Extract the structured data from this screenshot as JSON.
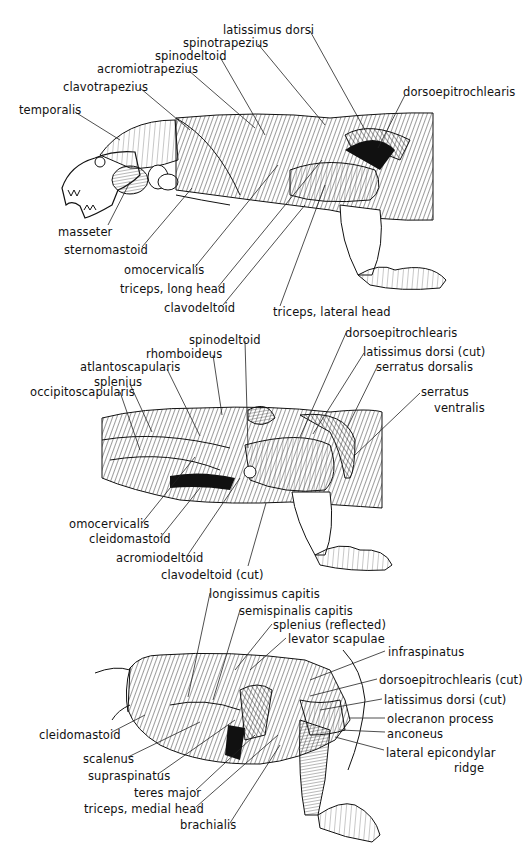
{
  "figure": {
    "panels": [
      {
        "id": "superficial",
        "labels": [
          {
            "text": "latissimus dorsi",
            "x": 223,
            "y": 24
          },
          {
            "text": "spinotrapezius",
            "x": 183,
            "y": 37
          },
          {
            "text": "spinodeltoid",
            "x": 155,
            "y": 50
          },
          {
            "text": "acromiotrapezius",
            "x": 97,
            "y": 63
          },
          {
            "text": "clavotrapezius",
            "x": 63,
            "y": 81
          },
          {
            "text": "dorsoepitrochlearis",
            "x": 403,
            "y": 86
          },
          {
            "text": "temporalis",
            "x": 19,
            "y": 104
          },
          {
            "text": "masseter",
            "x": 58,
            "y": 226
          },
          {
            "text": "sternomastoid",
            "x": 64,
            "y": 244
          },
          {
            "text": "omocervicalis",
            "x": 124,
            "y": 264
          },
          {
            "text": "triceps, long head",
            "x": 120,
            "y": 283
          },
          {
            "text": "clavodeltoid",
            "x": 164,
            "y": 302
          },
          {
            "text": "triceps, lateral head",
            "x": 273,
            "y": 306
          }
        ]
      },
      {
        "id": "intermediate",
        "labels": [
          {
            "text": "spinodeltoid",
            "x": 189,
            "y": 334
          },
          {
            "text": "dorsoepitrochlearis",
            "x": 345,
            "y": 327
          },
          {
            "text": "rhomboideus",
            "x": 146,
            "y": 348
          },
          {
            "text": "latissimus dorsi (cut)",
            "x": 363,
            "y": 346
          },
          {
            "text": "atlantoscapularis",
            "x": 80,
            "y": 361
          },
          {
            "text": "serratus dorsalis",
            "x": 376,
            "y": 361
          },
          {
            "text": "splenius",
            "x": 94,
            "y": 376
          },
          {
            "text": "occipitoscapularis",
            "x": 30,
            "y": 386
          },
          {
            "text": "serratus",
            "x": 421,
            "y": 386
          },
          {
            "text": "ventralis",
            "x": 434,
            "y": 402
          },
          {
            "text": "omocervicalis",
            "x": 69,
            "y": 518
          },
          {
            "text": "cleidomastoid",
            "x": 89,
            "y": 533
          },
          {
            "text": "acromiodeltoid",
            "x": 116,
            "y": 552
          },
          {
            "text": "clavodeltoid (cut)",
            "x": 161,
            "y": 569
          }
        ]
      },
      {
        "id": "deep",
        "labels": [
          {
            "text": "longissimus capitis",
            "x": 209,
            "y": 588
          },
          {
            "text": "semispinalis capitis",
            "x": 239,
            "y": 605
          },
          {
            "text": "splenius (reflected)",
            "x": 273,
            "y": 619
          },
          {
            "text": "levator scapulae",
            "x": 288,
            "y": 633
          },
          {
            "text": "infraspinatus",
            "x": 388,
            "y": 646
          },
          {
            "text": "dorsoepitrochlearis (cut)",
            "x": 379,
            "y": 674
          },
          {
            "text": "latissimus dorsi (cut)",
            "x": 384,
            "y": 694
          },
          {
            "text": "olecranon process",
            "x": 387,
            "y": 713
          },
          {
            "text": "cleidomastoid",
            "x": 39,
            "y": 729
          },
          {
            "text": "anconeus",
            "x": 387,
            "y": 728
          },
          {
            "text": "lateral epicondylar",
            "x": 386,
            "y": 747
          },
          {
            "text": "scalenus",
            "x": 83,
            "y": 753
          },
          {
            "text": "ridge",
            "x": 454,
            "y": 762
          },
          {
            "text": "supraspinatus",
            "x": 88,
            "y": 770
          },
          {
            "text": "teres major",
            "x": 134,
            "y": 787
          },
          {
            "text": "triceps, medial head",
            "x": 84,
            "y": 803
          },
          {
            "text": "brachialis",
            "x": 180,
            "y": 819
          }
        ]
      }
    ]
  }
}
